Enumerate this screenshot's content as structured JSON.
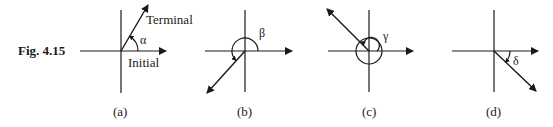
{
  "figure": {
    "label": "Fig. 4.15",
    "panels": [
      {
        "id": "a",
        "caption": "(a)",
        "angle_symbol": "α",
        "terminal_label": "Terminal",
        "initial_label": "Initial",
        "terminal_direction_deg": 60
      },
      {
        "id": "b",
        "caption": "(b)",
        "angle_symbol": "β",
        "terminal_direction_deg": 225
      },
      {
        "id": "c",
        "caption": "(c)",
        "angle_symbol": "γ",
        "terminal_direction_deg": 495
      },
      {
        "id": "d",
        "caption": "(d)",
        "angle_symbol": "δ",
        "terminal_direction_deg": -45
      }
    ]
  }
}
